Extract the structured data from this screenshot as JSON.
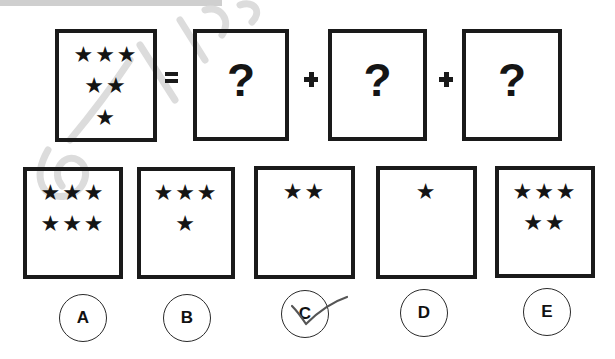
{
  "puzzle": {
    "equation": {
      "given_box": {
        "star_rows": [
          "★★★",
          "★★",
          "★"
        ],
        "star_count": 6
      },
      "equals_symbol": "=",
      "plus_symbol": "+",
      "unknown_boxes": [
        {
          "label": "?"
        },
        {
          "label": "?"
        },
        {
          "label": "?"
        }
      ]
    },
    "options": [
      {
        "letter": "A",
        "star_rows": [
          "★★★",
          "★★★"
        ],
        "star_count": 6
      },
      {
        "letter": "B",
        "star_rows": [
          "★★★",
          "★"
        ],
        "star_count": 4
      },
      {
        "letter": "C",
        "star_rows": [
          "★★"
        ],
        "star_count": 2,
        "checked": true
      },
      {
        "letter": "D",
        "star_rows": [
          "★"
        ],
        "star_count": 1
      },
      {
        "letter": "E",
        "star_rows": [
          "★★★",
          "★★"
        ],
        "star_count": 5
      }
    ],
    "marked_answer": "C"
  },
  "colors": {
    "ink": "#1a1a1a",
    "watermark": "#d4d4d4",
    "top_bar": "#cfcfcf",
    "checkmark": "#555555"
  }
}
